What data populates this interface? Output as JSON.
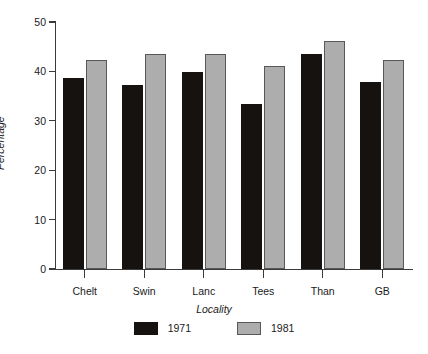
{
  "chart_data": {
    "type": "bar",
    "title": "",
    "subtitle": "",
    "xlabel": "Locality",
    "ylabel": "Percentage",
    "categories": [
      "Chelt",
      "Swin",
      "Lanc",
      "Tees",
      "Than",
      "GB"
    ],
    "series": [
      {
        "name": "1971",
        "color": "#151210",
        "values": [
          38.6,
          37.3,
          39.8,
          33.4,
          43.5,
          37.9
        ]
      },
      {
        "name": "1981",
        "color": "#adadad",
        "values": [
          42.3,
          43.5,
          43.6,
          41.0,
          46.1,
          42.3
        ]
      }
    ],
    "ylim": [
      0,
      50
    ],
    "yticks": [
      0,
      10,
      20,
      30,
      40,
      50
    ],
    "ytick_labels": [
      "0",
      "10",
      "20",
      "30",
      "40",
      "50"
    ],
    "grid": false,
    "legend_position": "bottom",
    "legend_entries": [
      "1971",
      "1981"
    ]
  }
}
